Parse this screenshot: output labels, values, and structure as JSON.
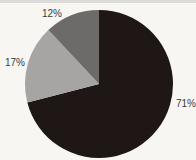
{
  "chart_data": {
    "type": "pie",
    "title": "",
    "start_angle": "12 o'clock, clockwise",
    "slices": [
      {
        "label": "71%",
        "value": 71,
        "color": "#1f1616"
      },
      {
        "label": "17%",
        "value": 17,
        "color": "#a6a5a3"
      },
      {
        "label": "12%",
        "value": 12,
        "color": "#6c6b69"
      }
    ],
    "legend": "none"
  }
}
